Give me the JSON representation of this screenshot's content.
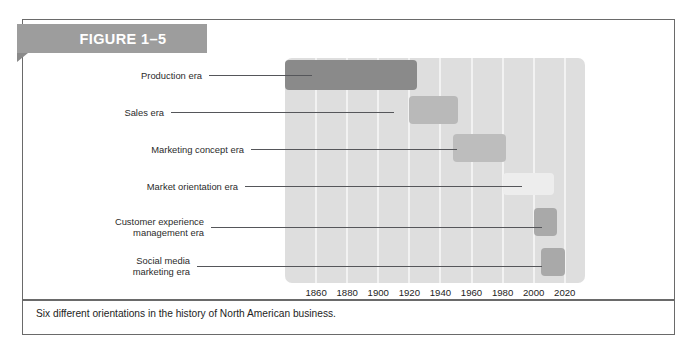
{
  "figure": {
    "ribbon_label": "FIGURE 1–5",
    "caption": "Six different orientations in the history of North American business.",
    "frame_color": "#6a6a6a",
    "ribbon_color": "#9d9d9d"
  },
  "chart_data": {
    "type": "bar",
    "orientation": "horizontal",
    "title": "FIGURE 1–5",
    "subtitle": "Six different orientations in the history of North American business.",
    "xlabel": "",
    "ylabel": "",
    "xlim": [
      1840,
      2033
    ],
    "xticks": [
      1860,
      1880,
      1900,
      1920,
      1940,
      1960,
      1980,
      2000,
      2020
    ],
    "xtick_labels": [
      "1860",
      "1880",
      "1900",
      "1920",
      "1940",
      "1960",
      "1980",
      "2000",
      "2020"
    ],
    "grid": "vertical-only",
    "legend": "none",
    "plot_background": "#dedede",
    "gridline_color": "#f2f2f2",
    "categories": [
      "Production era",
      "Sales era",
      "Marketing concept era",
      "Market orientation era",
      "Customer experience\nmanagement era",
      "Social media\nmarketing era"
    ],
    "bars": [
      {
        "label": "Production era",
        "label_display": "Production era",
        "start": 1840,
        "end": 1925,
        "color": "#8a8a8a",
        "row": 0
      },
      {
        "label": "Sales era",
        "label_display": "Sales era",
        "start": 1920,
        "end": 1951,
        "color": "#b9b9b9",
        "row": 1
      },
      {
        "label": "Marketing concept era",
        "label_display": "Marketing concept era",
        "start": 1948,
        "end": 1982,
        "color": "#bdbdbd",
        "row": 2
      },
      {
        "label": "Market orientation era",
        "label_display": "Market orientation era",
        "start": 1980,
        "end": 2013,
        "color": "#ededed",
        "row": 3
      },
      {
        "label": "Customer experience management era",
        "label_display": "Customer experience\nmanagement era",
        "start": 2000,
        "end": 2015,
        "color": "#a9a9a9",
        "row": 4
      },
      {
        "label": "Social media marketing era",
        "label_display": "Social media\nmarketing era",
        "start": 2005,
        "end": 2020,
        "color": "#a9a9a9",
        "row": 5
      }
    ]
  }
}
